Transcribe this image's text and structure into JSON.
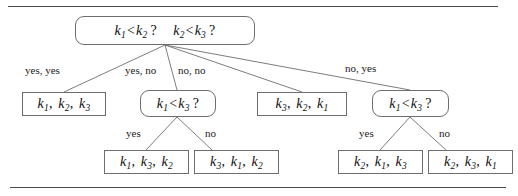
{
  "figure": {
    "rules": {
      "top": "horizontal-rule",
      "bottom": "horizontal-rule"
    }
  },
  "nodes": {
    "root": {
      "id": "root",
      "shape": "rounded-rect",
      "kind": "decision",
      "text": "k1 <k2 ?  k2 <k3 ?",
      "comparisons": [
        {
          "left": "k1",
          "op": "<",
          "right": "k2"
        },
        {
          "left": "k2",
          "op": "<",
          "right": "k3"
        }
      ]
    },
    "leaf_a": {
      "id": "leaf_a",
      "shape": "rect",
      "kind": "result",
      "text": "k1 , k2 , k3",
      "order": [
        "k1",
        "k2",
        "k3"
      ]
    },
    "decision_b": {
      "id": "decision_b",
      "shape": "rounded-rect",
      "kind": "decision",
      "text": "k1 <k3 ?",
      "comparisons": [
        {
          "left": "k1",
          "op": "<",
          "right": "k3"
        }
      ]
    },
    "leaf_c": {
      "id": "leaf_c",
      "shape": "rect",
      "kind": "result",
      "text": "k3 , k2 , k1",
      "order": [
        "k3",
        "k2",
        "k1"
      ]
    },
    "decision_d": {
      "id": "decision_d",
      "shape": "rounded-rect",
      "kind": "decision",
      "text": "k1 <k3 ?",
      "comparisons": [
        {
          "left": "k1",
          "op": "<",
          "right": "k3"
        }
      ]
    },
    "leaf_e": {
      "id": "leaf_e",
      "shape": "rect",
      "kind": "result",
      "text": "k1 , k3 , k2",
      "order": [
        "k1",
        "k3",
        "k2"
      ]
    },
    "leaf_f": {
      "id": "leaf_f",
      "shape": "rect",
      "kind": "result",
      "text": "k3 , k1 , k2",
      "order": [
        "k3",
        "k1",
        "k2"
      ]
    },
    "leaf_g": {
      "id": "leaf_g",
      "shape": "rect",
      "kind": "result",
      "text": "k2 , k1 , k3",
      "order": [
        "k2",
        "k1",
        "k3"
      ]
    },
    "leaf_h": {
      "id": "leaf_h",
      "shape": "rect",
      "kind": "result",
      "text": "k2 , k3 , k1",
      "order": [
        "k2",
        "k3",
        "k1"
      ]
    }
  },
  "edge_labels": {
    "yes_yes": "yes, yes",
    "yes_no": "yes, no",
    "no_no": "no, no",
    "no_yes": "no, yes",
    "b_yes": "yes",
    "b_no": "no",
    "d_yes": "yes",
    "d_no": "no"
  },
  "colors": {
    "stroke": "#6e6e6e",
    "rule": "#4a4a4a",
    "text": "#0f0f0f",
    "background": "#ffffff"
  }
}
